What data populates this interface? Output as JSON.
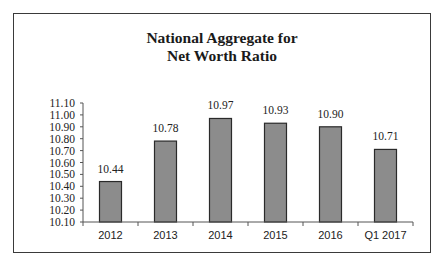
{
  "chart_data": {
    "type": "bar",
    "title": "National Aggregate for Net Worth Ratio",
    "title_lines": [
      "National Aggregate for",
      "Net Worth Ratio"
    ],
    "categories": [
      "2012",
      "2013",
      "2014",
      "2015",
      "2016",
      "Q1 2017"
    ],
    "values": [
      10.44,
      10.78,
      10.97,
      10.93,
      10.9,
      10.71
    ],
    "value_labels": [
      "10.44",
      "10.78",
      "10.97",
      "10.93",
      "10.90",
      "10.71"
    ],
    "xlabel": "",
    "ylabel": "",
    "ylim": [
      10.1,
      11.1
    ],
    "yticks": [
      "11.10",
      "11.00",
      "10.90",
      "10.80",
      "10.70",
      "10.60",
      "10.50",
      "10.40",
      "10.30",
      "10.20",
      "10.10"
    ],
    "grid": false,
    "legend": null,
    "bar_color": "#8c8c8c",
    "bar_edge_color": "#2a2a2a"
  }
}
